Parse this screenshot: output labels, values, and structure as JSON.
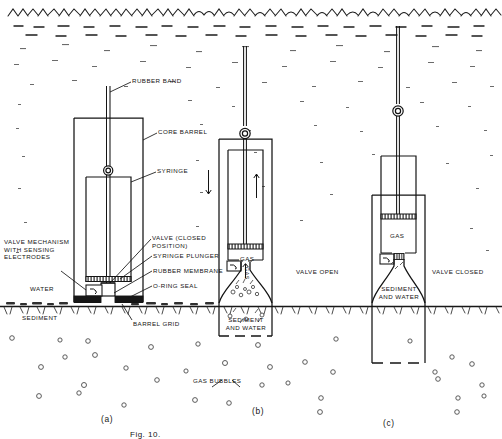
{
  "figure": {
    "caption": "Fig. 10.",
    "environment": {
      "water_label": "WATER",
      "sediment_label": "SEDIMENT",
      "gas_bubbles_label": "GAS BUBBLES"
    }
  },
  "panels": [
    {
      "key": "a",
      "caption": "(a)",
      "state_label": ""
    },
    {
      "key": "b",
      "caption": "(b)",
      "state_label": "VALVE OPEN"
    },
    {
      "key": "c",
      "caption": "(c)",
      "state_label": "VALVE CLOSED"
    }
  ],
  "callouts": {
    "rubber_band": "RUBBER BAND",
    "core_barrel": "CORE BARREL",
    "syringe": "SYRINGE",
    "valve_mechanism": "VALVE MECHANISM\nWITH SENSING\nELECTRODES",
    "valve_closed_position": "VALVE (CLOSED\nPOSITION)",
    "syringe_plunger": "SYRINGE PLUNGER",
    "rubber_membrane": "RUBBER MEMBRANE",
    "o_ring_seal": "O-RING SEAL",
    "barrel_grid": "BARREL GRID"
  },
  "contents": {
    "gas": "GAS",
    "gas_vertical": "GAS",
    "sediment_and_water": "SEDIMENT\nAND WATER"
  },
  "colors": {
    "ink": "#141414",
    "paper": "#ffffff",
    "hatch": "#2b2b2b"
  }
}
